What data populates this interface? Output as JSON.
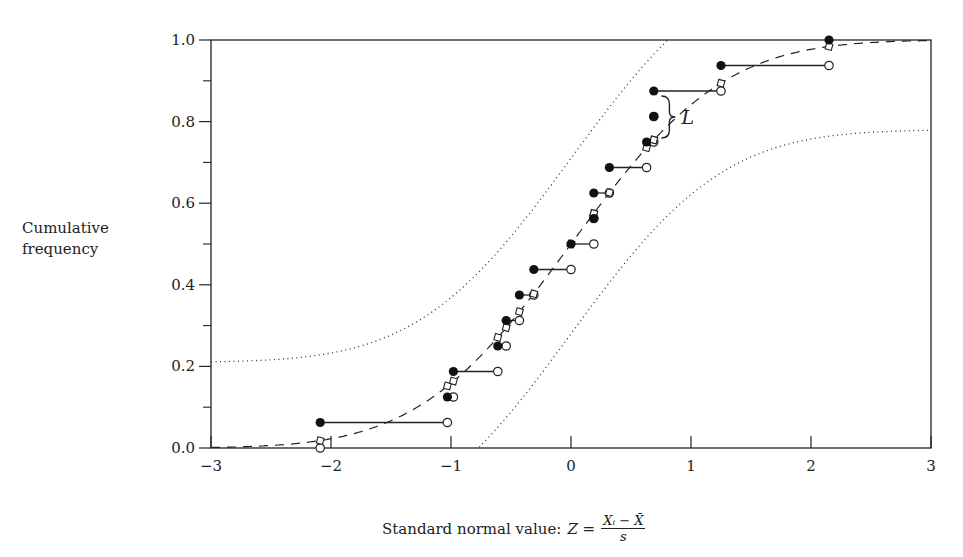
{
  "chart_data": {
    "type": "scatter",
    "title": "",
    "xlabel": "Standard normal value: Z = (X_i − X̄) / s",
    "ylabel": "Cumulative frequency",
    "xlim": [
      -3,
      3
    ],
    "ylim": [
      0.0,
      1.0
    ],
    "x_ticks": [
      -3,
      -2,
      -1,
      0,
      1,
      2,
      3
    ],
    "x_tick_labels": [
      "−3",
      "−2",
      "−1",
      "0",
      "1",
      "2",
      "3"
    ],
    "y_ticks": [
      0.0,
      0.2,
      0.4,
      0.6,
      0.8,
      1.0
    ],
    "y_tick_labels": [
      "0.0",
      "0.2",
      "0.4",
      "0.6",
      "0.8",
      "1.0"
    ],
    "y_minor_ticks": [
      0.1,
      0.3,
      0.5,
      0.7,
      0.9
    ],
    "grid": false,
    "legend": null,
    "annotation": {
      "text": "L",
      "x": 0.93,
      "y": 0.81,
      "description": "brace marking max deviation between empirical and normal CDF"
    },
    "series": [
      {
        "name": "Empirical CDF (filled circles, step upper points)",
        "marker": "filled-circle",
        "x": [
          -2.09,
          -1.03,
          -0.98,
          -0.61,
          -0.54,
          -0.43,
          -0.31,
          0.0,
          0.19,
          0.19,
          0.32,
          0.63,
          0.69,
          0.69,
          1.25,
          2.15
        ],
        "y": [
          0.0625,
          0.125,
          0.1875,
          0.25,
          0.3125,
          0.375,
          0.4375,
          0.5,
          0.5625,
          0.625,
          0.6875,
          0.75,
          0.8125,
          0.875,
          0.9375,
          1.0
        ]
      },
      {
        "name": "Empirical CDF (open circles, step end points)",
        "marker": "open-circle",
        "x": [
          -2.09,
          -1.03,
          -0.98,
          -0.61,
          -0.54,
          -0.43,
          -0.31,
          0.0,
          0.19,
          0.19,
          0.32,
          0.63,
          0.69,
          0.69,
          1.25,
          2.15
        ],
        "y": [
          0.0,
          0.0625,
          0.125,
          0.1875,
          0.25,
          0.3125,
          0.375,
          0.4375,
          0.5,
          0.5625,
          0.625,
          0.6875,
          0.75,
          0.8125,
          0.875,
          0.9375
        ],
        "step_end_x": [
          -1.03,
          -0.98,
          -0.61,
          -0.54,
          -0.43,
          -0.31,
          0.0,
          0.19,
          0.19,
          0.32,
          0.63,
          0.69,
          0.69,
          1.25,
          2.15,
          2.15
        ]
      },
      {
        "name": "Normal CDF at observed Z (diamonds)",
        "marker": "open-diamond",
        "x": [
          -2.09,
          -1.03,
          -0.98,
          -0.61,
          -0.54,
          -0.43,
          -0.31,
          0.0,
          0.19,
          0.19,
          0.32,
          0.63,
          0.69,
          0.69,
          1.25,
          2.15
        ],
        "y": [
          0.018,
          0.152,
          0.164,
          0.271,
          0.295,
          0.334,
          0.378,
          0.5,
          0.575,
          0.575,
          0.626,
          0.736,
          0.755,
          0.755,
          0.894,
          0.984
        ]
      },
      {
        "name": "Standard normal CDF",
        "line": "dashed",
        "function": "Phi(z)"
      },
      {
        "name": "Upper confidence band",
        "line": "dotted",
        "function": "min(1, Phi(z) + 0.21)"
      },
      {
        "name": "Lower confidence band",
        "line": "dotted",
        "function": "max(0, Phi(z) - 0.21)"
      }
    ]
  },
  "labels": {
    "ylabel_line1": "Cumulative",
    "ylabel_line2": "frequency",
    "xlabel_prefix": "Standard normal value:",
    "xlabel_Z": "Z =",
    "xlabel_num": "Xᵢ − X̄",
    "xlabel_den": "s",
    "annotation_L": "L"
  }
}
